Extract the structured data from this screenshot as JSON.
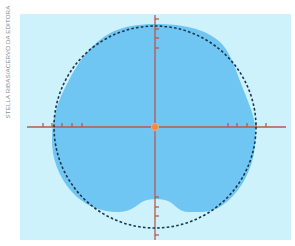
{
  "credit": "STELLA RIBAS/ACERVO DA EDITORA",
  "colors": {
    "panel": "#cdf2fb",
    "blob": "#6fc6f2",
    "axis": "#b8584a",
    "circle": "#1d3550",
    "origin": "#f08a4e"
  },
  "diagram": {
    "horizontal_ticks_left": 5,
    "horizontal_ticks_right": 5,
    "vertical_ticks_top": 4,
    "vertical_ticks_bottom": 4
  }
}
